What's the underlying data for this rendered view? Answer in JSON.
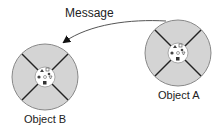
{
  "diagram": {
    "message_label": "Message",
    "objects": [
      {
        "name": "Object A",
        "cx": 178,
        "cy": 53,
        "r": 33
      },
      {
        "name": "Object B",
        "cx": 45,
        "cy": 77,
        "r": 33
      }
    ],
    "colors": {
      "ring_fill": "#d4d4d4",
      "ring_stroke": "#888888",
      "divider": "#222222",
      "core_fill": "#ffffff",
      "arrow": "#555555"
    }
  }
}
